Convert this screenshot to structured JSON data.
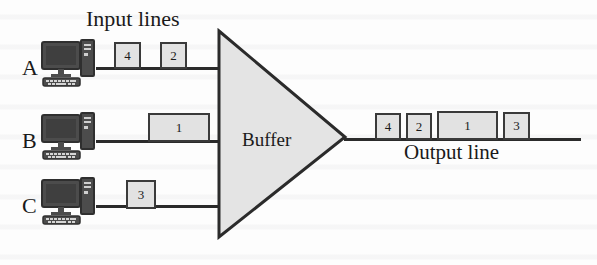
{
  "figure": {
    "title_input_lines": "Input lines",
    "title_output_line": "Output line",
    "buffer_label": "Buffer",
    "accent_line_color": "#2b2b2b",
    "packet_fill_color": "#e2e2e2",
    "packet_border_color": "#3a3a3a",
    "buffer_fill_color": "#e4e4e4",
    "background_color": "#fdfdfd"
  },
  "hosts": [
    {
      "letter": "A",
      "packets": [
        {
          "label": "4"
        },
        {
          "label": "2"
        }
      ]
    },
    {
      "letter": "B",
      "packets": [
        {
          "label": "1"
        }
      ]
    },
    {
      "letter": "C",
      "packets": [
        {
          "label": "3"
        }
      ]
    }
  ],
  "output_packets": [
    {
      "label": "4"
    },
    {
      "label": "2"
    },
    {
      "label": "1"
    },
    {
      "label": "3"
    }
  ],
  "icons": {
    "computer": "computer-icon"
  }
}
